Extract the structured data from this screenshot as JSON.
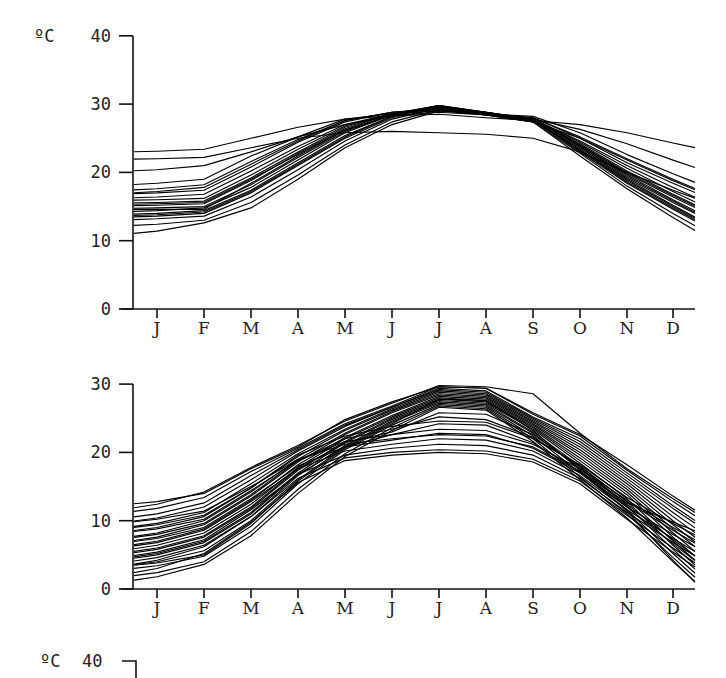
{
  "chart_data": [
    {
      "type": "line",
      "title": "",
      "unit_label": "ºC",
      "ylabel": "ºC",
      "xlabel": "",
      "categories": [
        "J",
        "F",
        "M",
        "A",
        "M",
        "J",
        "J",
        "A",
        "S",
        "O",
        "N",
        "D"
      ],
      "ylim": [
        0,
        40
      ],
      "yticks": [
        0,
        10,
        20,
        30,
        40
      ],
      "grid": false,
      "legend": "none",
      "description": "Monthly mean temperature curves for many stations (overlaid, unlabeled series); warm-winter group",
      "series": [
        {
          "name": "s1",
          "values": [
            23.1,
            23.4,
            25.0,
            26.6,
            27.8,
            28.3,
            28.5,
            28.0,
            27.6,
            27.0,
            25.8,
            24.3
          ]
        },
        {
          "name": "s2",
          "values": [
            20.4,
            21.0,
            23.0,
            25.2,
            27.0,
            28.3,
            28.8,
            28.4,
            27.8,
            26.3,
            24.2,
            21.8
          ]
        },
        {
          "name": "s3",
          "values": [
            18.4,
            19.0,
            22.4,
            25.2,
            27.8,
            28.6,
            29.0,
            28.6,
            28.2,
            25.8,
            22.6,
            19.8
          ]
        },
        {
          "name": "s4",
          "values": [
            17.6,
            18.2,
            21.6,
            24.8,
            27.6,
            28.8,
            29.2,
            28.6,
            28.0,
            25.2,
            22.0,
            19.0
          ]
        },
        {
          "name": "s5",
          "values": [
            17.0,
            17.4,
            20.8,
            24.4,
            27.4,
            28.8,
            29.4,
            28.6,
            28.0,
            25.0,
            21.4,
            18.4
          ]
        },
        {
          "name": "s6",
          "values": [
            16.4,
            16.8,
            20.2,
            23.8,
            27.0,
            28.6,
            29.6,
            28.6,
            27.8,
            24.6,
            21.0,
            17.8
          ]
        },
        {
          "name": "s7",
          "values": [
            16.0,
            16.2,
            19.6,
            23.4,
            26.8,
            28.6,
            29.6,
            28.6,
            27.8,
            24.4,
            20.6,
            17.2
          ]
        },
        {
          "name": "s8",
          "values": [
            15.6,
            15.8,
            19.2,
            23.0,
            26.6,
            28.6,
            29.8,
            28.6,
            27.8,
            24.2,
            20.2,
            16.8
          ]
        },
        {
          "name": "s9",
          "values": [
            15.2,
            15.4,
            18.8,
            22.8,
            26.4,
            28.6,
            29.8,
            28.8,
            27.8,
            24.0,
            19.8,
            16.4
          ]
        },
        {
          "name": "s10",
          "values": [
            14.8,
            15.0,
            18.2,
            22.2,
            26.0,
            28.4,
            29.8,
            28.8,
            27.8,
            23.8,
            19.6,
            16.0
          ]
        },
        {
          "name": "s11",
          "values": [
            14.4,
            14.8,
            17.8,
            21.8,
            25.8,
            28.4,
            29.6,
            28.6,
            27.6,
            23.6,
            19.2,
            15.6
          ]
        },
        {
          "name": "s12",
          "values": [
            14.0,
            14.4,
            17.4,
            21.4,
            25.4,
            28.2,
            29.6,
            28.6,
            27.6,
            23.4,
            19.0,
            15.2
          ]
        },
        {
          "name": "s13",
          "values": [
            13.6,
            14.0,
            17.0,
            21.0,
            25.0,
            28.0,
            29.4,
            28.6,
            27.6,
            23.2,
            18.8,
            15.0
          ]
        },
        {
          "name": "s14",
          "values": [
            13.2,
            13.6,
            16.4,
            20.4,
            24.6,
            27.8,
            29.4,
            28.6,
            27.6,
            23.0,
            18.4,
            14.6
          ]
        },
        {
          "name": "s15",
          "values": [
            12.4,
            13.0,
            15.6,
            19.6,
            24.0,
            27.4,
            29.2,
            28.4,
            27.4,
            22.8,
            18.0,
            14.0
          ]
        },
        {
          "name": "s16",
          "values": [
            11.4,
            12.6,
            14.8,
            19.0,
            23.6,
            27.0,
            29.0,
            28.4,
            27.4,
            22.4,
            17.6,
            13.4
          ]
        },
        {
          "name": "s17",
          "values": [
            15.4,
            15.6,
            19.0,
            22.6,
            26.2,
            28.4,
            29.6,
            28.6,
            27.8,
            24.0,
            20.0,
            16.6
          ]
        },
        {
          "name": "s18",
          "values": [
            14.6,
            14.6,
            18.4,
            22.4,
            26.2,
            28.4,
            29.8,
            28.8,
            27.8,
            23.8,
            19.4,
            15.8
          ]
        },
        {
          "name": "s19",
          "values": [
            17.2,
            17.8,
            21.2,
            24.6,
            27.6,
            28.8,
            29.2,
            28.4,
            27.4,
            25.0,
            21.8,
            18.8
          ]
        },
        {
          "name": "s20",
          "values": [
            13.8,
            14.2,
            17.2,
            21.2,
            25.2,
            28.2,
            29.6,
            28.8,
            27.8,
            23.2,
            18.6,
            14.8
          ]
        },
        {
          "name": "s21",
          "values": [
            22.0,
            22.2,
            23.6,
            25.0,
            25.8,
            26.0,
            25.8,
            25.6,
            25.0,
            23.0,
            20.0,
            17.4
          ]
        }
      ],
      "x_start_value_note": "lines begin at the y-axis (before J) and end past D"
    },
    {
      "type": "line",
      "title": "",
      "ylabel": "",
      "xlabel": "",
      "categories": [
        "J",
        "F",
        "M",
        "A",
        "M",
        "J",
        "J",
        "A",
        "S",
        "O",
        "N",
        "D"
      ],
      "ylim": [
        0,
        30
      ],
      "yticks": [
        0,
        10,
        20,
        30
      ],
      "grid": false,
      "legend": "none",
      "description": "Monthly mean temperature curves for many stations (overlaid, unlabeled series); cool-winter group",
      "series": [
        {
          "name": "t1",
          "values": [
            12.4,
            14.2,
            17.8,
            21.0,
            24.6,
            27.2,
            29.8,
            29.6,
            28.6,
            22.8,
            17.6,
            13.2
          ]
        },
        {
          "name": "t2",
          "values": [
            11.8,
            13.4,
            17.2,
            20.6,
            24.2,
            26.8,
            29.6,
            29.4,
            25.6,
            22.4,
            17.4,
            12.8
          ]
        },
        {
          "name": "t3",
          "values": [
            11.0,
            12.6,
            16.6,
            20.4,
            24.0,
            26.6,
            29.4,
            29.0,
            25.2,
            22.0,
            17.0,
            12.2
          ]
        },
        {
          "name": "t4",
          "values": [
            10.4,
            12.0,
            16.0,
            20.2,
            23.8,
            26.6,
            29.2,
            28.8,
            25.0,
            21.6,
            16.6,
            11.8
          ]
        },
        {
          "name": "t5",
          "values": [
            9.6,
            11.2,
            15.4,
            19.8,
            23.4,
            26.4,
            29.0,
            28.6,
            24.8,
            21.2,
            16.2,
            11.2
          ]
        },
        {
          "name": "t6",
          "values": [
            9.0,
            10.6,
            14.8,
            19.4,
            23.2,
            26.2,
            28.8,
            28.4,
            24.6,
            20.8,
            15.8,
            10.6
          ]
        },
        {
          "name": "t7",
          "values": [
            8.2,
            10.0,
            14.2,
            19.0,
            22.8,
            26.0,
            28.6,
            28.2,
            24.4,
            20.4,
            15.4,
            10.0
          ]
        },
        {
          "name": "t8",
          "values": [
            7.6,
            9.4,
            13.6,
            18.6,
            22.6,
            25.8,
            28.4,
            28.0,
            24.2,
            20.0,
            15.0,
            9.4
          ]
        },
        {
          "name": "t9",
          "values": [
            7.0,
            8.8,
            13.0,
            18.2,
            22.2,
            25.4,
            28.2,
            27.8,
            24.0,
            19.6,
            14.6,
            8.8
          ]
        },
        {
          "name": "t10",
          "values": [
            6.4,
            8.2,
            12.4,
            17.8,
            22.0,
            25.2,
            28.0,
            27.6,
            23.8,
            19.2,
            14.2,
            8.2
          ]
        },
        {
          "name": "t11",
          "values": [
            5.8,
            7.6,
            11.8,
            17.4,
            21.6,
            25.0,
            27.8,
            27.4,
            23.6,
            18.8,
            13.8,
            7.6
          ]
        },
        {
          "name": "t12",
          "values": [
            5.2,
            7.0,
            11.2,
            17.0,
            21.4,
            24.8,
            27.6,
            27.2,
            23.4,
            18.4,
            13.2,
            7.0
          ]
        },
        {
          "name": "t13",
          "values": [
            4.6,
            6.4,
            10.6,
            16.6,
            21.0,
            24.6,
            27.4,
            27.0,
            23.0,
            18.0,
            12.8,
            6.4
          ]
        },
        {
          "name": "t14",
          "values": [
            4.0,
            5.6,
            10.0,
            16.0,
            20.8,
            24.4,
            27.2,
            26.8,
            22.8,
            17.6,
            12.2,
            5.8
          ]
        },
        {
          "name": "t15",
          "values": [
            3.4,
            4.8,
            9.2,
            15.4,
            20.4,
            24.0,
            27.0,
            26.6,
            22.4,
            17.0,
            11.6,
            5.2
          ]
        },
        {
          "name": "t16",
          "values": [
            2.4,
            4.0,
            8.4,
            14.6,
            19.8,
            23.6,
            26.8,
            26.4,
            22.0,
            16.4,
            11.0,
            4.6
          ]
        },
        {
          "name": "t17",
          "values": [
            1.8,
            3.6,
            7.8,
            14.0,
            19.4,
            23.2,
            26.6,
            26.2,
            21.6,
            16.0,
            10.4,
            4.0
          ]
        },
        {
          "name": "t18",
          "values": [
            8.8,
            10.2,
            14.4,
            18.8,
            21.6,
            22.6,
            23.4,
            23.2,
            21.2,
            17.6,
            13.0,
            9.0
          ]
        },
        {
          "name": "t19",
          "values": [
            10.2,
            11.4,
            15.0,
            19.0,
            21.2,
            22.0,
            22.6,
            22.4,
            20.8,
            17.2,
            12.6,
            9.8
          ]
        },
        {
          "name": "t20",
          "values": [
            6.8,
            8.6,
            12.8,
            17.6,
            20.2,
            21.2,
            22.0,
            21.8,
            20.2,
            16.6,
            11.6,
            7.4
          ]
        },
        {
          "name": "t21",
          "values": [
            5.4,
            7.2,
            11.6,
            16.8,
            19.6,
            20.6,
            21.2,
            21.0,
            19.6,
            16.2,
            11.2,
            6.8
          ]
        },
        {
          "name": "t22",
          "values": [
            4.2,
            6.2,
            10.6,
            16.2,
            19.2,
            20.0,
            20.4,
            20.2,
            19.0,
            15.8,
            10.8,
            6.0
          ]
        },
        {
          "name": "t23",
          "values": [
            3.0,
            5.2,
            9.8,
            15.6,
            18.8,
            19.6,
            20.0,
            19.8,
            18.6,
            15.4,
            10.2,
            5.4
          ]
        },
        {
          "name": "t24",
          "values": [
            7.4,
            9.0,
            13.2,
            18.0,
            20.8,
            21.8,
            22.8,
            22.6,
            20.6,
            17.0,
            12.0,
            8.0
          ]
        },
        {
          "name": "t25",
          "values": [
            9.4,
            10.8,
            14.8,
            19.6,
            22.4,
            23.8,
            24.6,
            24.4,
            22.0,
            18.2,
            13.4,
            9.6
          ]
        },
        {
          "name": "t26",
          "values": [
            8.0,
            9.6,
            13.8,
            18.8,
            22.0,
            23.4,
            25.2,
            24.8,
            22.2,
            18.0,
            12.8,
            8.6
          ]
        },
        {
          "name": "t27",
          "values": [
            6.0,
            7.8,
            12.0,
            17.6,
            21.4,
            23.0,
            25.8,
            25.6,
            22.6,
            17.8,
            12.4,
            7.2
          ]
        },
        {
          "name": "t28",
          "values": [
            5.0,
            6.8,
            11.0,
            16.8,
            20.8,
            22.6,
            24.2,
            24.0,
            21.4,
            17.2,
            12.0,
            6.6
          ]
        },
        {
          "name": "t29",
          "values": [
            12.8,
            14.0,
            17.6,
            20.8,
            24.8,
            27.4,
            29.6,
            29.4,
            25.8,
            22.6,
            18.2,
            13.6
          ]
        },
        {
          "name": "t30",
          "values": [
            3.8,
            5.0,
            9.6,
            15.8,
            20.6,
            24.2,
            27.8,
            27.6,
            23.2,
            17.4,
            11.4,
            4.2
          ]
        }
      ]
    },
    {
      "type": "line",
      "title": "",
      "ylabel": "ºC",
      "partial": true,
      "yticks_visible": [
        40
      ],
      "description": "Top of a third panel, cut off at image bottom; only the ºC 40 label and axis corner visible"
    }
  ],
  "panels": {
    "top": {
      "unit": "ºC",
      "yticks": [
        "0",
        "10",
        "20",
        "30",
        "40"
      ]
    },
    "middle": {
      "yticks": [
        "0",
        "10",
        "20",
        "30"
      ]
    },
    "bottom_partial": {
      "unit": "ºC",
      "ytick": "40"
    }
  }
}
